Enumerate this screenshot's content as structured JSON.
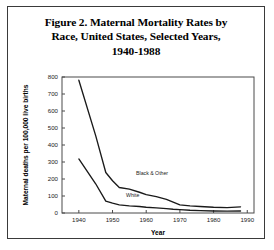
{
  "figure": {
    "title_lines": [
      "Figure 2. Maternal Mortality Rates by",
      "Race, United States, Selected Years,",
      "1940-1988"
    ],
    "border_color": "#3a3a3a"
  },
  "chart_data": {
    "type": "line",
    "title": "Figure 2. Maternal Mortality Rates by Race, United States, Selected Years, 1940-1988",
    "xlabel": "Year",
    "ylabel": "Maternal deaths per 100,000 live births",
    "xlim": [
      1935,
      1992
    ],
    "ylim": [
      0,
      800
    ],
    "xticks": [
      1940,
      1950,
      1960,
      1970,
      1980,
      1990
    ],
    "xtick_labels": [
      "1940",
      "1950",
      "1960",
      "1970",
      "1980",
      "1990"
    ],
    "yticks": [
      0,
      100,
      200,
      300,
      400,
      500,
      600,
      700,
      800
    ],
    "ytick_labels": [
      "0",
      "100",
      "200",
      "300",
      "400",
      "500",
      "600",
      "700",
      "800"
    ],
    "grid": false,
    "legend": "inline-labels",
    "line_color": "#1a1a1a",
    "series": [
      {
        "name": "Black & Other",
        "label_position": {
          "x": 1957,
          "y": 225
        },
        "x": [
          1940,
          1945,
          1948,
          1950,
          1952,
          1955,
          1958,
          1960,
          1963,
          1966,
          1968,
          1970,
          1973,
          1976,
          1980,
          1984,
          1988
        ],
        "values": [
          781,
          455,
          238,
          190,
          150,
          140,
          122,
          108,
          96,
          80,
          64,
          48,
          42,
          38,
          34,
          32,
          36
        ]
      },
      {
        "name": "White",
        "label_position": {
          "x": 1954,
          "y": 92
        },
        "x": [
          1940,
          1945,
          1948,
          1950,
          1952,
          1955,
          1958,
          1960,
          1963,
          1966,
          1968,
          1970,
          1973,
          1976,
          1980,
          1984,
          1988
        ],
        "values": [
          318,
          172,
          70,
          58,
          48,
          42,
          38,
          34,
          30,
          26,
          22,
          20,
          16,
          14,
          12,
          11,
          12
        ]
      }
    ]
  }
}
